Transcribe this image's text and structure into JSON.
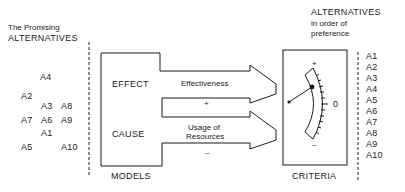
{
  "left_panel": {
    "title_line1": "The Promising",
    "title_line2": "ALTERNATIVES",
    "scattered_alternatives": [
      {
        "label": "A4",
        "x": 40,
        "y": 73
      },
      {
        "label": "A2",
        "x": 21,
        "y": 92
      },
      {
        "label": "A3",
        "x": 41,
        "y": 102
      },
      {
        "label": "A8",
        "x": 61,
        "y": 102
      },
      {
        "label": "A7",
        "x": 21,
        "y": 116
      },
      {
        "label": "A6",
        "x": 41,
        "y": 116
      },
      {
        "label": "A9",
        "x": 61,
        "y": 116
      },
      {
        "label": "A1",
        "x": 41,
        "y": 129
      },
      {
        "label": "A5",
        "x": 21,
        "y": 143
      },
      {
        "label": "A10",
        "x": 61,
        "y": 143
      }
    ]
  },
  "models_box": {
    "effect_label": "EFFECT",
    "cause_label": "CAUSE",
    "caption": "MODELS"
  },
  "arrows": {
    "top": {
      "label": "Effectiveness",
      "sign": "+"
    },
    "bottom": {
      "label_line1": "Usage of",
      "label_line2": "Resources",
      "sign": "–"
    }
  },
  "criteria": {
    "caption": "CRITERIA",
    "gauge_plus": "+",
    "gauge_zero": "0",
    "gauge_minus": "–"
  },
  "right_panel": {
    "title_line1": "ALTERNATIVES",
    "title_line2": "in order of",
    "title_line3": "preference",
    "ranked_alternatives": [
      "A1",
      "A2",
      "A3",
      "A4",
      "A5",
      "A6",
      "A7",
      "A8",
      "A9",
      "A10"
    ]
  }
}
